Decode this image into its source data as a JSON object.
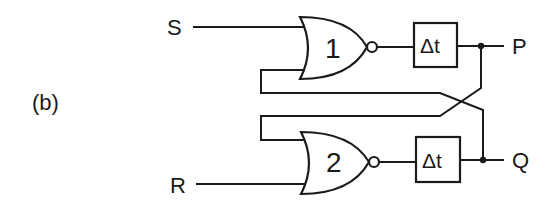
{
  "figure_label": "(b)",
  "inputs": {
    "set": "S",
    "reset": "R"
  },
  "outputs": {
    "top": "P",
    "bottom": "Q"
  },
  "gates": [
    {
      "id": "gate-1",
      "type": "NOR",
      "label": "1"
    },
    {
      "id": "gate-2",
      "type": "NOR",
      "label": "2"
    }
  ],
  "delays": [
    {
      "id": "delay-top",
      "label": "Δt"
    },
    {
      "id": "delay-bottom",
      "label": "Δt"
    }
  ],
  "colors": {
    "ink": "#1a1a1a",
    "background": "#ffffff"
  }
}
